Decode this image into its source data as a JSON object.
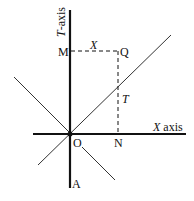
{
  "diagram": {
    "type": "spacetime-diagram",
    "axes": {
      "t_axis_label_var": "T",
      "t_axis_label_suffix": "-axis",
      "x_axis_label_var": "X",
      "x_axis_label_suffix": " axis"
    },
    "points": {
      "M": "M",
      "Q": "Q",
      "O": "O",
      "N": "N",
      "A": "A"
    },
    "segment_labels": {
      "MQ": "X",
      "NQ": "T"
    },
    "colors": {
      "ink": "#111111",
      "background": "#ffffff"
    }
  }
}
